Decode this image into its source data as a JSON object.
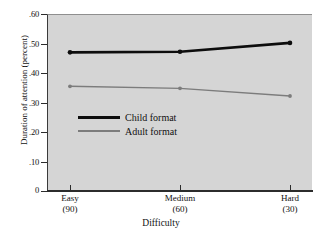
{
  "chart_data": {
    "type": "line",
    "title": "",
    "xlabel": "Difficulty",
    "ylabel": "Duration of attention (percent)",
    "categories": [
      "Easy",
      "Medium",
      "Hard"
    ],
    "category_sublabels": [
      "(90)",
      "(60)",
      "(30)"
    ],
    "ylim": [
      0,
      0.6
    ],
    "yticks": [
      0.6,
      0.5,
      0.4,
      0.3,
      0.2,
      0.1,
      0
    ],
    "ytick_labels": [
      ".60",
      ".50",
      ".40",
      ".30",
      ".20",
      ".10",
      "0"
    ],
    "grid": false,
    "legend_position": "inside-center-left",
    "series": [
      {
        "name": "Child format",
        "values": [
          0.47,
          0.472,
          0.502
        ],
        "color": "#0d0d0d",
        "line_width": 2.6,
        "marker": "circle"
      },
      {
        "name": "Adult format",
        "values": [
          0.355,
          0.348,
          0.322
        ],
        "color": "#7c7c7c",
        "line_width": 1.4,
        "marker": "circle"
      }
    ],
    "plot_background": "#d5d5d5",
    "figure_background": "#ffffff"
  },
  "axes": {
    "y_ticks": [
      {
        "label": ".60",
        "value": 0.6
      },
      {
        "label": ".50",
        "value": 0.5
      },
      {
        "label": ".40",
        "value": 0.4
      },
      {
        "label": ".30",
        "value": 0.3
      },
      {
        "label": ".20",
        "value": 0.2
      },
      {
        "label": ".10",
        "value": 0.1
      },
      {
        "label": "0",
        "value": 0
      }
    ],
    "x_ticks": [
      {
        "label": "Easy",
        "sub": "(90)"
      },
      {
        "label": "Medium",
        "sub": "(60)"
      },
      {
        "label": "Hard",
        "sub": "(30)"
      }
    ],
    "x_title": "Difficulty",
    "y_title": "Duration of attention (percent)"
  },
  "legend": {
    "entries": [
      {
        "label": "Child format",
        "style": "thick-black"
      },
      {
        "label": "Adult format",
        "style": "thin-gray"
      }
    ]
  }
}
